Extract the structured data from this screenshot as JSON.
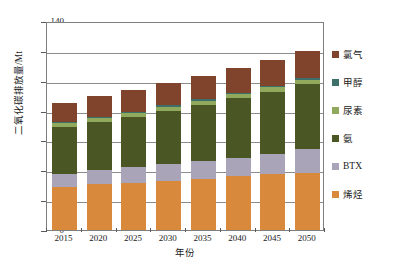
{
  "chart_data": {
    "type": "bar",
    "stacked": true,
    "title": "",
    "xlabel": "年份",
    "ylabel": "二氧化碳排放量/Mt",
    "categories": [
      "2015",
      "2020",
      "2025",
      "2030",
      "2035",
      "2040",
      "2045",
      "2050"
    ],
    "ylim": [
      0,
      140
    ],
    "yticks": [
      0,
      20,
      40,
      60,
      80,
      100,
      120,
      140
    ],
    "grid": true,
    "legend_position": "right",
    "series": [
      {
        "name": "烯烃",
        "color": "#D9893C",
        "values": [
          28.5,
          30.5,
          31.5,
          33.0,
          34.5,
          36.0,
          37.5,
          38.5
        ]
      },
      {
        "name": "BTX",
        "color": "#A9A4B8",
        "values": [
          9.0,
          9.5,
          10.5,
          11.0,
          11.5,
          12.5,
          13.5,
          15.5
        ]
      },
      {
        "name": "氨",
        "color": "#4A5725",
        "values": [
          31.5,
          32.5,
          34.0,
          36.0,
          38.0,
          40.0,
          41.5,
          43.5
        ]
      },
      {
        "name": "尿素",
        "color": "#90A95D",
        "values": [
          2.5,
          2.5,
          2.5,
          2.5,
          2.5,
          2.5,
          3.0,
          3.0
        ]
      },
      {
        "name": "甲醇",
        "color": "#3D7069",
        "values": [
          0.8,
          0.8,
          0.8,
          1.0,
          1.0,
          1.0,
          1.0,
          1.2
        ]
      },
      {
        "name": "氯气",
        "color": "#80432C",
        "values": [
          12.7,
          13.7,
          14.7,
          15.0,
          16.0,
          16.5,
          17.5,
          18.3
        ]
      }
    ],
    "totals": [
      85,
      89.5,
      94,
      98.5,
      103.5,
      108.5,
      114,
      120
    ]
  },
  "legend": {
    "items": [
      {
        "label": "氯气",
        "color": "#80432C"
      },
      {
        "label": "甲醇",
        "color": "#3D7069"
      },
      {
        "label": "尿素",
        "color": "#90A95D"
      },
      {
        "label": "氨",
        "color": "#4A5725"
      },
      {
        "label": "BTX",
        "color": "#A9A4B8"
      },
      {
        "label": "烯烃",
        "color": "#D9893C"
      }
    ]
  }
}
